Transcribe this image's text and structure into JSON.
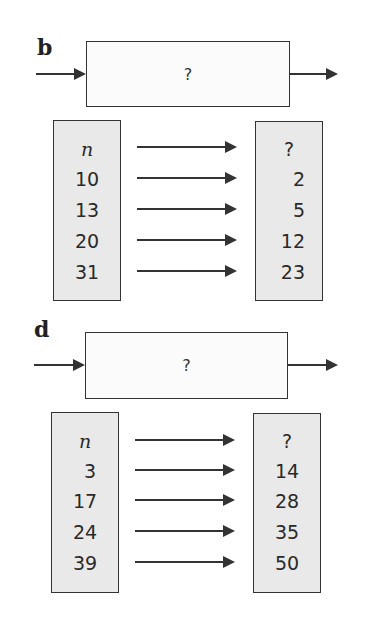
{
  "sections": [
    {
      "label": "b",
      "machine_label": "?",
      "input_header": "n",
      "output_header": "?",
      "inputs": [
        "10",
        "13",
        "20",
        "31"
      ],
      "outputs": [
        "2",
        "5",
        "12",
        "23"
      ]
    },
    {
      "label": "d",
      "machine_label": "?",
      "input_header": "n",
      "output_header": "?",
      "inputs": [
        "3",
        "17",
        "24",
        "39"
      ],
      "outputs": [
        "14",
        "28",
        "35",
        "50"
      ]
    }
  ]
}
